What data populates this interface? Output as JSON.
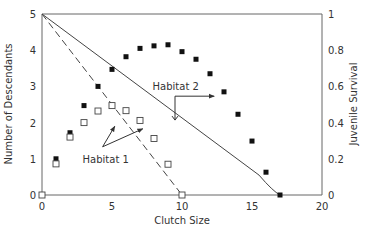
{
  "chart_data": {
    "type": "scatter",
    "title": "",
    "xlabel": "Clutch Size",
    "ylabel": "Number of Descendants",
    "y2label": "Juvenile Survival",
    "xlim": [
      0,
      20
    ],
    "ylim": [
      0,
      5
    ],
    "y2lim": [
      0,
      1
    ],
    "xticks": [
      "0",
      "5",
      "10",
      "15",
      "20"
    ],
    "xtick_values": [
      0,
      5,
      10,
      15,
      20
    ],
    "yticks": [
      "0",
      "1",
      "2",
      "3",
      "4",
      "5"
    ],
    "ytick_values": [
      0,
      1,
      2,
      3,
      4,
      5
    ],
    "y2ticks": [
      "0",
      "0.2",
      "0.4",
      "0.6",
      "0.8",
      "1"
    ],
    "y2tick_values": [
      0,
      0.2,
      0.4,
      0.6,
      0.8,
      1
    ],
    "grid": false,
    "series": [
      {
        "name": "Habitat 2 descendants",
        "marker": "filled-square",
        "axis": "left",
        "x": [
          0,
          1,
          2,
          3,
          4,
          5,
          6,
          7,
          8,
          9,
          10,
          11,
          12,
          13,
          14,
          15,
          16,
          17
        ],
        "y": [
          0,
          1.0,
          1.72,
          2.47,
          3.0,
          3.47,
          3.82,
          4.05,
          4.12,
          4.15,
          3.96,
          3.75,
          3.35,
          2.85,
          2.23,
          1.49,
          0.63,
          0
        ]
      },
      {
        "name": "Habitat 1 descendants",
        "marker": "open-square",
        "axis": "left",
        "x": [
          0,
          1,
          2,
          3,
          4,
          5,
          6,
          7,
          8,
          9,
          10
        ],
        "y": [
          0,
          0.86,
          1.6,
          2.0,
          2.32,
          2.47,
          2.33,
          2.06,
          1.56,
          0.85,
          0
        ]
      },
      {
        "name": "Habitat 2 juvenile survival",
        "style": "solid-line",
        "axis": "right",
        "x": [
          0,
          15.5,
          16.5,
          17
        ],
        "y": [
          1.0,
          0.11,
          0.02,
          0
        ]
      },
      {
        "name": "Habitat 1 juvenile survival",
        "style": "dashed-line",
        "axis": "right",
        "x": [
          0,
          10
        ],
        "y": [
          1.0,
          0
        ]
      }
    ],
    "annotations": [
      {
        "text": "Habitat 1",
        "x": 2.9,
        "y": 1.0,
        "arrows_to": [
          [
            5.2,
            1.9
          ],
          [
            7.2,
            1.83
          ]
        ]
      },
      {
        "text": "Habitat 2",
        "x": 7.9,
        "y": 3.0,
        "arrow_path": [
          [
            9.5,
            2.07
          ],
          [
            9.5,
            2.73
          ],
          [
            12.3,
            2.73
          ]
        ]
      }
    ]
  }
}
